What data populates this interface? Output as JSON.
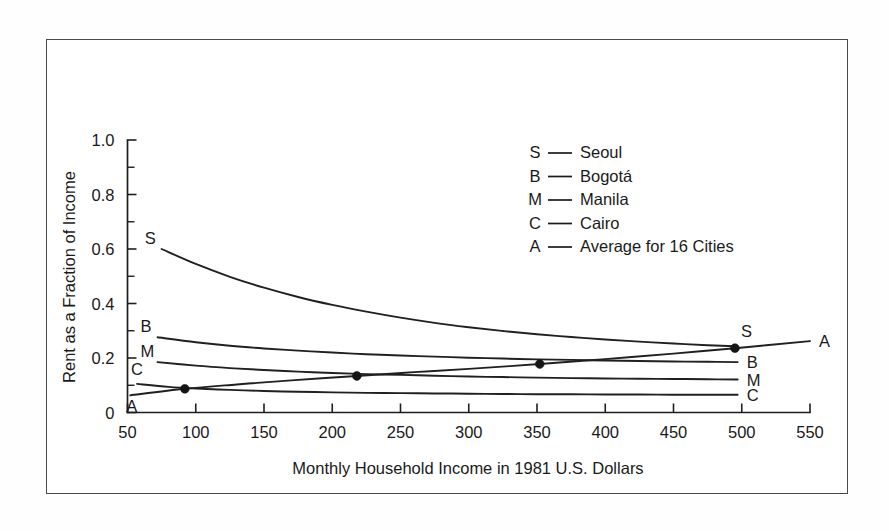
{
  "figure": {
    "frame_visible": true,
    "background_color": "#ffffff",
    "border_color": "#4a4a4a",
    "ink_color": "#202020"
  },
  "chart_data": {
    "type": "line",
    "title": "",
    "subtitle": "",
    "xlabel": "Monthly Household Income in 1981 U.S. Dollars",
    "ylabel": "Rent as a Fraction of Income",
    "xlim": [
      50,
      550
    ],
    "ylim": [
      0,
      1.0
    ],
    "grid": false,
    "legend_position": "upper-right-inside",
    "x_ticks": [
      50,
      100,
      150,
      200,
      250,
      300,
      350,
      400,
      450,
      500,
      550
    ],
    "x_tick_labels": [
      "50",
      "100",
      "150",
      "200",
      "250",
      "300",
      "350",
      "400",
      "450",
      "500",
      "550"
    ],
    "y_ticks": [
      0,
      0.2,
      0.4,
      0.6,
      0.8,
      1.0
    ],
    "y_tick_labels": [
      "0",
      "0.2",
      "0.4",
      "0.6",
      "0.8",
      "1.0"
    ],
    "y_minor_ticks": [
      0.1,
      0.3,
      0.5,
      0.7,
      0.9
    ],
    "series": [
      {
        "key": "S",
        "name": "Seoul",
        "start_label": "S",
        "end_label": "S",
        "x": [
          75,
          100,
          125,
          150,
          175,
          200,
          225,
          250,
          275,
          300,
          325,
          350,
          375,
          400,
          425,
          450,
          475,
          495
        ],
        "values": [
          0.6,
          0.545,
          0.498,
          0.458,
          0.424,
          0.395,
          0.37,
          0.348,
          0.329,
          0.313,
          0.299,
          0.287,
          0.277,
          0.268,
          0.26,
          0.253,
          0.247,
          0.243
        ],
        "markers": []
      },
      {
        "key": "B",
        "name": "Bogotá",
        "start_label": "B",
        "end_label": "B",
        "x": [
          72,
          100,
          125,
          150,
          175,
          200,
          225,
          250,
          275,
          300,
          325,
          350,
          375,
          400,
          425,
          450,
          475,
          497
        ],
        "values": [
          0.276,
          0.258,
          0.245,
          0.235,
          0.227,
          0.22,
          0.214,
          0.209,
          0.205,
          0.201,
          0.198,
          0.195,
          0.193,
          0.191,
          0.189,
          0.187,
          0.186,
          0.185
        ],
        "markers": []
      },
      {
        "key": "M",
        "name": "Manila",
        "start_label": "M",
        "end_label": "M",
        "x": [
          72,
          100,
          125,
          150,
          175,
          200,
          225,
          250,
          275,
          300,
          325,
          350,
          375,
          400,
          425,
          450,
          475,
          497
        ],
        "values": [
          0.185,
          0.172,
          0.163,
          0.156,
          0.15,
          0.145,
          0.141,
          0.138,
          0.135,
          0.132,
          0.13,
          0.128,
          0.126,
          0.125,
          0.124,
          0.123,
          0.122,
          0.121
        ],
        "markers": []
      },
      {
        "key": "C",
        "name": "Cairo",
        "start_label": "C",
        "end_label": "C",
        "x": [
          57,
          80,
          100,
          125,
          150,
          175,
          200,
          225,
          250,
          275,
          300,
          325,
          350,
          375,
          400,
          425,
          450,
          475,
          497
        ],
        "values": [
          0.105,
          0.094,
          0.088,
          0.083,
          0.079,
          0.076,
          0.074,
          0.072,
          0.071,
          0.07,
          0.069,
          0.068,
          0.067,
          0.067,
          0.066,
          0.066,
          0.065,
          0.065,
          0.065
        ],
        "markers": []
      },
      {
        "key": "A",
        "name": "Average for 16 Cities",
        "start_label": "A",
        "end_label": "A",
        "x": [
          52,
          92,
          130,
          170,
          218,
          260,
          300,
          352,
          400,
          450,
          495,
          550
        ],
        "values": [
          0.063,
          0.087,
          0.103,
          0.118,
          0.134,
          0.148,
          0.16,
          0.178,
          0.196,
          0.216,
          0.236,
          0.262
        ],
        "markers": [
          {
            "x": 92,
            "y": 0.087
          },
          {
            "x": 218,
            "y": 0.134
          },
          {
            "x": 352,
            "y": 0.178
          },
          {
            "x": 495,
            "y": 0.236
          }
        ]
      }
    ],
    "legend": [
      {
        "key": "S",
        "label": "Seoul"
      },
      {
        "key": "B",
        "label": "Bogotá"
      },
      {
        "key": "M",
        "label": "Manila"
      },
      {
        "key": "C",
        "label": "Cairo"
      },
      {
        "key": "A",
        "label": "Average for 16 Cities"
      }
    ]
  }
}
